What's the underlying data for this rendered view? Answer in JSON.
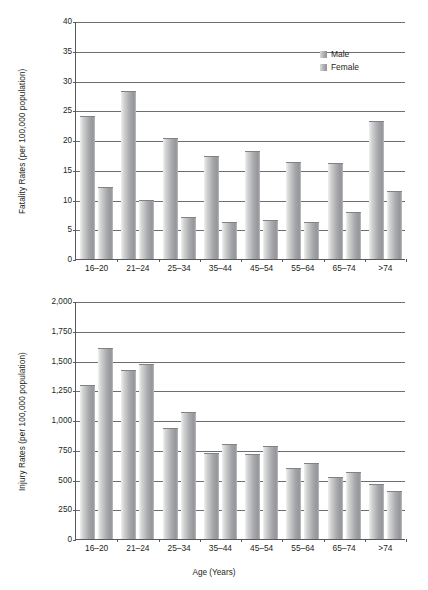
{
  "chart_data": [
    {
      "type": "bar",
      "id": "fatality-rates",
      "title": "",
      "xlabel": "",
      "ylabel": "Fatality Rates (per 100,000 population)",
      "categories": [
        "16–20",
        "21–24",
        "25–34",
        "35–44",
        "45–54",
        "55–64",
        "65–74",
        ">74"
      ],
      "series": [
        {
          "name": "Male",
          "values": [
            23.8,
            28.0,
            20.1,
            17.2,
            18.0,
            16.2,
            16.0,
            23.0
          ]
        },
        {
          "name": "Female",
          "values": [
            12.0,
            9.8,
            6.9,
            6.1,
            6.4,
            6.1,
            7.8,
            11.2
          ]
        }
      ],
      "ylim": [
        0,
        40
      ],
      "yticks": [
        0,
        5,
        10,
        15,
        20,
        25,
        30,
        35,
        40
      ],
      "ytick_labels": [
        "0",
        "5",
        "10",
        "15",
        "20",
        "25",
        "30",
        "35",
        "40"
      ],
      "grid": true,
      "legend_position": "top-right",
      "legend": [
        "Male",
        "Female"
      ]
    },
    {
      "type": "bar",
      "id": "injury-rates",
      "title": "",
      "xlabel": "Age (Years)",
      "ylabel": "Injury Rates (per 100,000 population)",
      "categories": [
        "16–20",
        "21–24",
        "25–34",
        "35–44",
        "45–54",
        "55–64",
        "65–74",
        ">74"
      ],
      "series": [
        {
          "name": "Male",
          "values": [
            1290,
            1410,
            925,
            715,
            705,
            590,
            515,
            450
          ]
        },
        {
          "name": "Female",
          "values": [
            1595,
            1465,
            1060,
            790,
            775,
            630,
            555,
            395
          ]
        }
      ],
      "ylim": [
        0,
        2000
      ],
      "yticks": [
        0,
        250,
        500,
        750,
        1000,
        1250,
        1500,
        1750,
        2000
      ],
      "ytick_labels": [
        "0",
        "250",
        "500",
        "750",
        "1,000",
        "1,250",
        "1,500",
        "1,750",
        "2,000"
      ],
      "grid": true,
      "legend_position": "none",
      "legend": []
    }
  ],
  "colors": {
    "bar_light": "#d9d9d9",
    "bar_mid": "#a7a9ac",
    "bar_dark": "#939598",
    "axis": "#58595b",
    "grid": "#6d6e71",
    "text": "#231f20",
    "background": "#ffffff"
  }
}
